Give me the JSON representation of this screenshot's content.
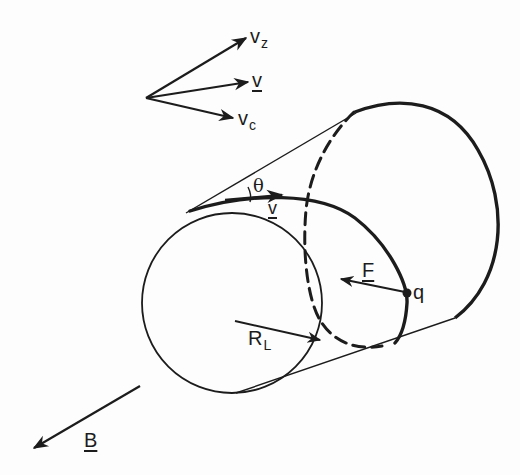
{
  "figure": {
    "colors": {
      "ink": "#1c1c1c",
      "background": "#fdfdfd"
    }
  },
  "velocity_diagram": {
    "vz_label": "v",
    "vz_sub": "z",
    "v_label": "v",
    "vc_label": "v",
    "vc_sub": "c"
  },
  "cylinder": {
    "pitch_angle_label": "θ",
    "helix_velocity_label": "v",
    "force_label": "F",
    "charge_label": "q",
    "radius_label": "R",
    "radius_sub": "L"
  },
  "field": {
    "b_label": "B"
  }
}
